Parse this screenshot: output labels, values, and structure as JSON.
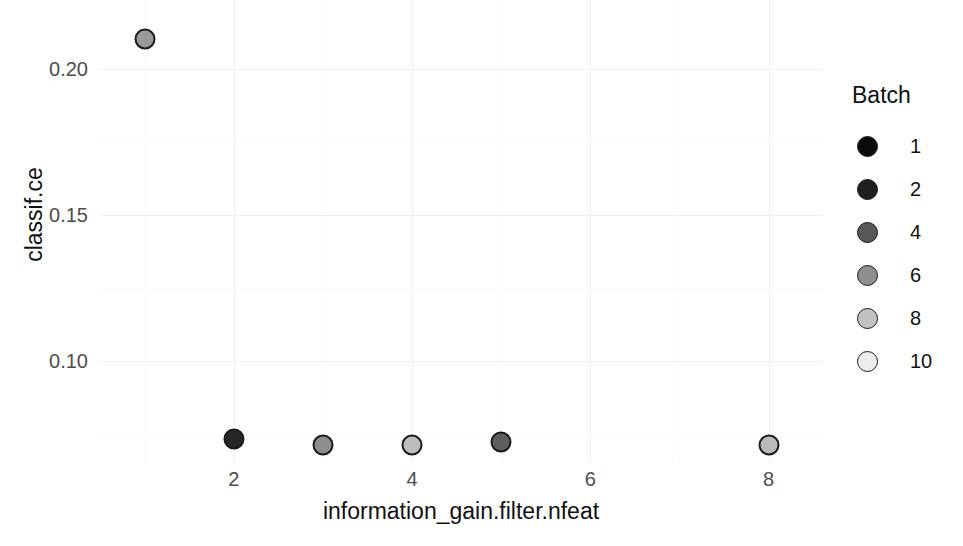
{
  "chart_data": {
    "type": "scatter",
    "title": "",
    "xlabel": "information_gain.filter.nfeat",
    "ylabel": "classif.ce",
    "xlim": [
      0.5,
      8.6
    ],
    "ylim": [
      0.0655,
      0.2235
    ],
    "x_ticks": [
      2,
      4,
      6,
      8
    ],
    "x_tick_labels": [
      "2",
      "4",
      "6",
      "8"
    ],
    "y_ticks": [
      0.1,
      0.15,
      0.2
    ],
    "y_tick_labels": [
      "0.10",
      "0.15",
      "0.20"
    ],
    "grid": true,
    "legend_position": "right",
    "legend": {
      "title": "Batch",
      "entries": [
        {
          "label": "1",
          "value": 1,
          "color": "#0b0b0b"
        },
        {
          "label": "2",
          "value": 2,
          "color": "#1f1f1f"
        },
        {
          "label": "4",
          "value": 4,
          "color": "#585858"
        },
        {
          "label": "6",
          "value": 6,
          "color": "#8e8e8e"
        },
        {
          "label": "8",
          "value": 8,
          "color": "#c2c2c2"
        },
        {
          "label": "10",
          "value": 10,
          "color": "#ededed"
        }
      ]
    },
    "points": [
      {
        "x": 1,
        "y": 0.2103,
        "batch": 6,
        "color": "#9a9a9a"
      },
      {
        "x": 2,
        "y": 0.0732,
        "batch": 2,
        "color": "#262626"
      },
      {
        "x": 3,
        "y": 0.0712,
        "batch": 4,
        "color": "#8d8d8d"
      },
      {
        "x": 4,
        "y": 0.0712,
        "batch": 8,
        "color": "#bdbdbd"
      },
      {
        "x": 5,
        "y": 0.0722,
        "batch": 4,
        "color": "#5e5e5e"
      },
      {
        "x": 8,
        "y": 0.0712,
        "batch": 8,
        "color": "#bababa"
      }
    ],
    "series": [
      {
        "name": "Batch",
        "x": [
          1,
          2,
          3,
          4,
          5,
          8
        ],
        "values": [
          0.2103,
          0.0732,
          0.0712,
          0.0712,
          0.0722,
          0.0712
        ],
        "batches": [
          6,
          2,
          4,
          8,
          4,
          8
        ]
      }
    ],
    "marker": {
      "shape": "circle-filled",
      "outline_color": "#1a1a1a",
      "size_px": 21
    },
    "panel_background": "#ffffff",
    "gridline_color": "#f0f0f0"
  }
}
